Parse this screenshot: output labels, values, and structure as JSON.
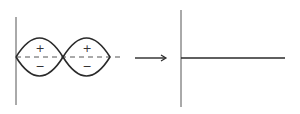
{
  "diagram": {
    "colors": {
      "stroke": "#2a2a2a",
      "dashed": "#555555",
      "background": "#ffffff"
    },
    "left_panel": {
      "axis": {
        "x": 16,
        "y_top": 17,
        "y_bottom": 105
      },
      "baseline_y": 57,
      "dashed_line": {
        "x_start": 16,
        "x_end": 120
      },
      "lobes": [
        {
          "x_start": 16,
          "x_end": 63,
          "amplitude": 19,
          "upper_sign": "+",
          "lower_sign": "−"
        },
        {
          "x_start": 63,
          "x_end": 110,
          "amplitude": 19,
          "upper_sign": "+",
          "lower_sign": "−"
        }
      ]
    },
    "arrow": {
      "x_start": 135,
      "x_end": 166,
      "y": 58,
      "icon": "right-arrow-icon"
    },
    "right_panel": {
      "axis": {
        "x": 181,
        "y_top": 10,
        "y_bottom": 107
      },
      "line": {
        "x_start": 181,
        "x_end": 285,
        "y": 58
      }
    }
  }
}
